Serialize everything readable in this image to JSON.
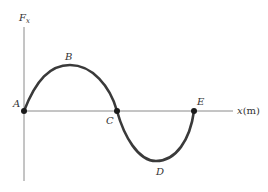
{
  "diagram": {
    "type": "force-vs-position graph",
    "y_axis": {
      "label": "F",
      "subscript": "x"
    },
    "x_axis": {
      "label_var": "x",
      "label_unit": "(m)"
    },
    "points": [
      {
        "id": "A",
        "label": "A",
        "role": "zero crossing (start)"
      },
      {
        "id": "B",
        "label": "B",
        "role": "maximum"
      },
      {
        "id": "C",
        "label": "C",
        "role": "zero crossing"
      },
      {
        "id": "D",
        "label": "D",
        "role": "minimum"
      },
      {
        "id": "E",
        "label": "E",
        "role": "zero crossing (end)"
      }
    ],
    "colors": {
      "curve": "#3a3a3a",
      "axis": "#8a8a8a",
      "text": "#333333",
      "point": "#1a1a1a"
    }
  }
}
